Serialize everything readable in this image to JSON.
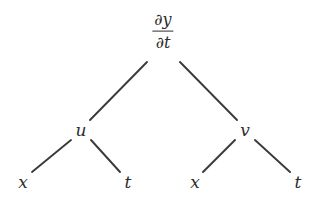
{
  "diagram": {
    "type": "tree",
    "canvas": {
      "width": 321,
      "height": 200,
      "background": "#ffffff"
    },
    "line_color": "#3a3a3a",
    "text_color": "#2e2e2e",
    "root": {
      "id": "root",
      "label_numerator": "∂y",
      "label_denominator": "∂t",
      "x": 163,
      "y": 31
    },
    "level2": [
      {
        "id": "u",
        "label": "u",
        "x": 81,
        "y": 130
      },
      {
        "id": "v",
        "label": "v",
        "x": 245,
        "y": 130
      }
    ],
    "leaves": [
      {
        "id": "leaf-x-left",
        "label": "x",
        "x": 23,
        "y": 182,
        "parent": "u"
      },
      {
        "id": "leaf-t-left",
        "label": "t",
        "x": 128,
        "y": 182,
        "parent": "u"
      },
      {
        "id": "leaf-x-right",
        "label": "x",
        "x": 195,
        "y": 182,
        "parent": "v"
      },
      {
        "id": "leaf-t-right",
        "label": "t",
        "x": 298,
        "y": 182,
        "parent": "v"
      }
    ],
    "edges": [
      {
        "id": "edge-root-u",
        "from": "root",
        "to": "u",
        "x1": 147,
        "y1": 62,
        "x2": 90,
        "y2": 120
      },
      {
        "id": "edge-root-v",
        "from": "root",
        "to": "v",
        "x1": 180,
        "y1": 62,
        "x2": 237,
        "y2": 120
      },
      {
        "id": "edge-u-x",
        "from": "u",
        "to": "leaf-x-left",
        "x1": 71,
        "y1": 140,
        "x2": 32,
        "y2": 172
      },
      {
        "id": "edge-u-t",
        "from": "u",
        "to": "leaf-t-left",
        "x1": 91,
        "y1": 140,
        "x2": 120,
        "y2": 172
      },
      {
        "id": "edge-v-x",
        "from": "v",
        "to": "leaf-x-right",
        "x1": 235,
        "y1": 140,
        "x2": 203,
        "y2": 172
      },
      {
        "id": "edge-v-t",
        "from": "v",
        "to": "leaf-t-right",
        "x1": 255,
        "y1": 140,
        "x2": 290,
        "y2": 172
      }
    ]
  }
}
